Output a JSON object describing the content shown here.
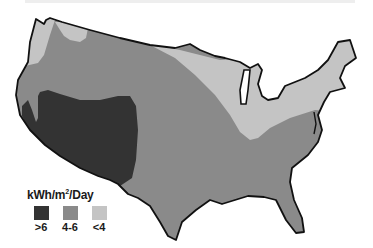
{
  "map": {
    "region": "Contiguous United States",
    "colors": {
      "high": "#333333",
      "medium": "#8a8a8a",
      "low": "#c4c4c4",
      "border": "#111111"
    }
  },
  "legend": {
    "title_prefix": "kWh/m",
    "title_sup": "2",
    "title_suffix": "/Day",
    "items": [
      {
        "label": ">6",
        "color": "#333333"
      },
      {
        "label": "4-6",
        "color": "#8a8a8a"
      },
      {
        "label": "<4",
        "color": "#c4c4c4"
      }
    ]
  }
}
